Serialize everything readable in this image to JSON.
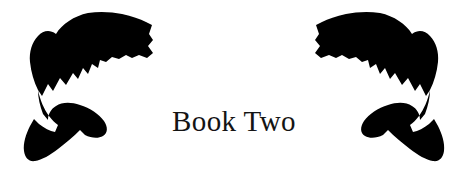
{
  "page": {
    "background_color": "#ffffff",
    "width": 468,
    "height": 176
  },
  "title_block": {
    "text": "Book Two",
    "color": "#141414"
  },
  "ornaments": {
    "left": {
      "icon_name": "leaping-fish-silhouette",
      "label": "Leaping fish silhouette (left)",
      "color": "#000000",
      "facing": "right"
    },
    "right": {
      "icon_name": "leaping-fish-silhouette",
      "label": "Leaping fish silhouette (right, mirrored)",
      "color": "#000000",
      "facing": "left"
    }
  }
}
